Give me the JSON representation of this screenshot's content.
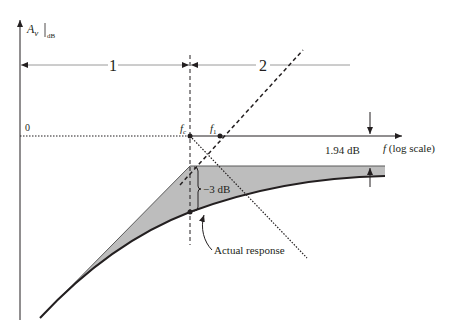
{
  "diagram": {
    "y_axis_label_main": "A",
    "y_axis_label_sub": "v",
    "y_axis_label_unit": "dB",
    "region_1_label": "1",
    "region_2_label": "2",
    "zero_label": "0",
    "fc_label_main": "f",
    "fc_label_sub": "c",
    "f1_label_main": "f",
    "f1_label_sub": "1",
    "x_axis_label_main": "f",
    "x_axis_label_rest": " (log scale)",
    "offset_label": "1.94 dB",
    "drop_label": "−3 dB",
    "curve_label": "Actual response",
    "colors": {
      "ink": "#231f20",
      "shade": "#bdbdbd",
      "guide": "#9a9a9a"
    }
  }
}
